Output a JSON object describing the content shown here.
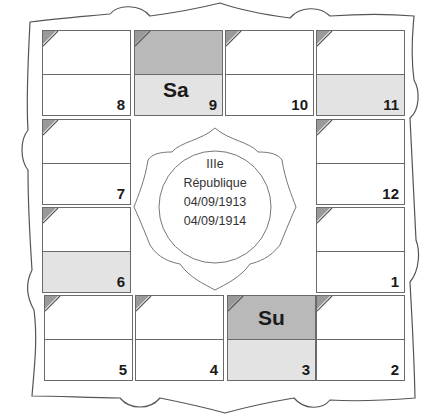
{
  "chart": {
    "title_lines": [
      "IIIe",
      "République",
      "04/09/1913",
      "04/09/1914"
    ],
    "colors": {
      "dark_shade": "#b9b9b9",
      "light_shade": "#e3e3e3",
      "border": "#6a6a6a",
      "corner": "#9a9a9a"
    },
    "houses": [
      {
        "number": "8",
        "top_shade": "none",
        "bottom_shade": "none",
        "planet": ""
      },
      {
        "number": "9",
        "top_shade": "dark",
        "bottom_shade": "light",
        "planet": "Sa"
      },
      {
        "number": "10",
        "top_shade": "none",
        "bottom_shade": "none",
        "planet": ""
      },
      {
        "number": "11",
        "top_shade": "none",
        "bottom_shade": "light",
        "planet": ""
      },
      {
        "number": "7",
        "top_shade": "none",
        "bottom_shade": "none",
        "planet": ""
      },
      {
        "number": "12",
        "top_shade": "none",
        "bottom_shade": "none",
        "planet": ""
      },
      {
        "number": "6",
        "top_shade": "none",
        "bottom_shade": "light",
        "planet": ""
      },
      {
        "number": "1",
        "top_shade": "none",
        "bottom_shade": "none",
        "planet": ""
      },
      {
        "number": "5",
        "top_shade": "none",
        "bottom_shade": "none",
        "planet": ""
      },
      {
        "number": "4",
        "top_shade": "none",
        "bottom_shade": "none",
        "planet": ""
      },
      {
        "number": "3",
        "top_shade": "dark",
        "bottom_shade": "light",
        "planet": "Su"
      },
      {
        "number": "2",
        "top_shade": "none",
        "bottom_shade": "none",
        "planet": ""
      }
    ]
  }
}
